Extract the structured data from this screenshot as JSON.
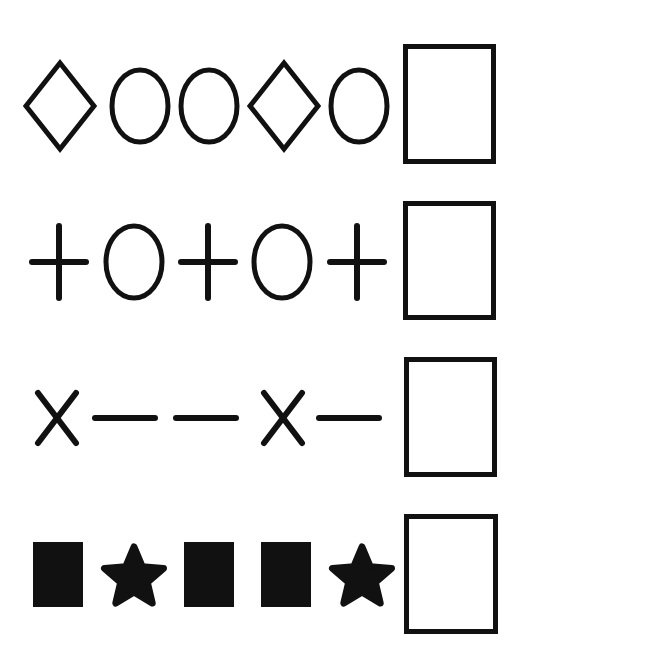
{
  "colors": {
    "ink": "#111111",
    "background": "#ffffff"
  },
  "rows": [
    {
      "name": "row-1",
      "sequence": [
        "diamond",
        "circle",
        "circle",
        "diamond",
        "circle"
      ],
      "answer_box": "empty"
    },
    {
      "name": "row-2",
      "sequence": [
        "plus",
        "circle",
        "plus",
        "circle",
        "plus"
      ],
      "answer_box": "empty"
    },
    {
      "name": "row-3",
      "sequence": [
        "cross",
        "dash",
        "dash",
        "cross",
        "dash"
      ],
      "answer_box": "empty"
    },
    {
      "name": "row-4",
      "sequence": [
        "filled-square",
        "star",
        "filled-square",
        "filled-square",
        "star"
      ],
      "answer_box": "empty"
    }
  ]
}
